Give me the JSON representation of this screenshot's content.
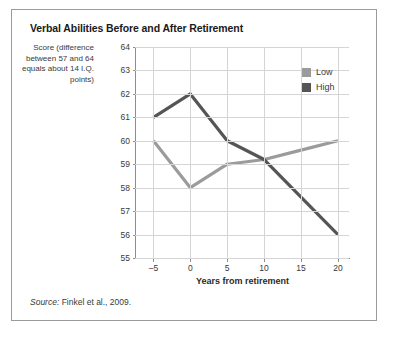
{
  "figure": {
    "title": "Verbal Abilities Before and After Retirement",
    "source_prefix": "Source:",
    "source_text": " Finkel et al., 2009."
  },
  "axis": {
    "y_caption": "Score (difference between 57 and 64 equals about 14 I.Q. points)",
    "x_label": "Years from retirement"
  },
  "legend": {
    "items": [
      {
        "label": "Low",
        "color": "#9b9b9b"
      },
      {
        "label": "High",
        "color": "#555555"
      }
    ]
  },
  "colors": {
    "low": "#9b9b9b",
    "high": "#555555",
    "grid": "#d5d5d5",
    "axis": "#8d8d8d",
    "frame": "#9b9b9b",
    "text": "#3a3a3a"
  },
  "chart_data": {
    "type": "line",
    "title": "Verbal Abilities Before and After Retirement",
    "xlabel": "Years from retirement",
    "ylabel": "Score (difference between 57 and 64 equals about 14 I.Q. points)",
    "x": [
      -5,
      0,
      5,
      10,
      15,
      20
    ],
    "xticklabels": [
      "–5",
      "0",
      "5",
      "10",
      "15",
      "20"
    ],
    "xlim": [
      -7.5,
      21.5
    ],
    "ylim": [
      55,
      64
    ],
    "yticks": [
      64,
      63,
      62,
      61,
      60,
      59,
      58,
      57,
      56,
      55
    ],
    "yticklabels": [
      "64",
      "63",
      "62",
      "61",
      "60",
      "59",
      "58",
      "57",
      "56",
      "55"
    ],
    "grid": true,
    "legend_position": "top-right",
    "series": [
      {
        "name": "Low",
        "color": "#9b9b9b",
        "values": [
          60,
          58,
          59,
          59.2,
          59.6,
          60
        ]
      },
      {
        "name": "High",
        "color": "#555555",
        "values": [
          61,
          62,
          60,
          59.2,
          57.6,
          56
        ]
      }
    ],
    "source": "Source: Finkel et al., 2009."
  }
}
